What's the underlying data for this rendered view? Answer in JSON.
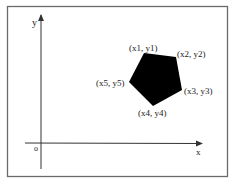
{
  "diagram": {
    "type": "coordinate-system-polygon",
    "colors": {
      "frame": "#6a6a6a",
      "axis": "#333333",
      "polygon_fill": "#000000",
      "text": "#222222",
      "background": "#ffffff"
    },
    "axes": {
      "x_label": "x",
      "y_label": "y",
      "origin_label": "o"
    },
    "polygon": {
      "shape": "pentagon",
      "vertices": [
        {
          "label": "(x1, y1)",
          "px": 144,
          "py": 53
        },
        {
          "label": "(x2, y2)",
          "px": 176,
          "py": 57
        },
        {
          "label": "(x3, y3)",
          "px": 182,
          "py": 90
        },
        {
          "label": "(x4, y4)",
          "px": 153,
          "py": 106
        },
        {
          "label": "(x5, y5)",
          "px": 129,
          "py": 82
        }
      ]
    }
  }
}
